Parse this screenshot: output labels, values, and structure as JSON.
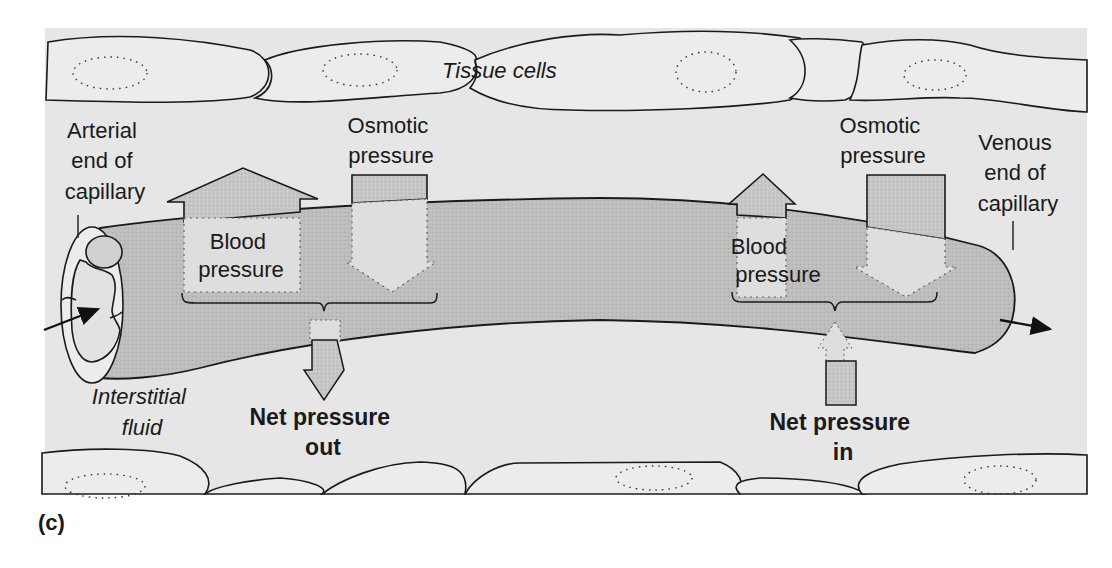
{
  "figure": {
    "caption": "(c)",
    "colors": {
      "panel_bg": "#e6e6e6",
      "cell_fill": "#ececec",
      "capillary_fill": "#bdbdbd",
      "arrow_fill": "#c6c6c6",
      "arrow_inner": "#dcdcdc",
      "stroke": "#1a1a1a"
    },
    "labels": {
      "tissue_cells": "Tissue cells",
      "arterial_end": [
        "Arterial",
        "end of",
        "capillary"
      ],
      "venous_end": [
        "Venous",
        "end of",
        "capillary"
      ],
      "interstitial_fluid": [
        "Interstitial",
        "fluid"
      ],
      "left_osmotic": [
        "Osmotic",
        "pressure"
      ],
      "right_osmotic": [
        "Osmotic",
        "pressure"
      ],
      "left_blood": [
        "Blood",
        "pressure"
      ],
      "right_blood": [
        "Blood",
        "pressure"
      ],
      "net_out": [
        "Net pressure",
        "out"
      ],
      "net_in": [
        "Net pressure",
        "in"
      ]
    }
  }
}
